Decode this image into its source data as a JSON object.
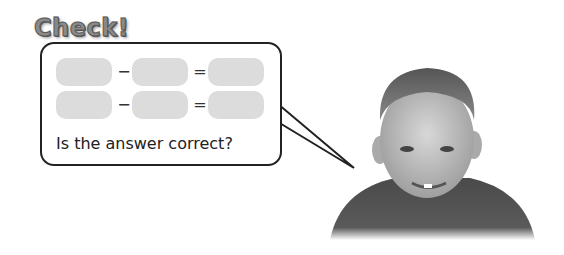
{
  "title": "Check!",
  "bubble": {
    "rows": [
      {
        "op1": "−",
        "op2": "="
      },
      {
        "op1": "−",
        "op2": "="
      }
    ],
    "question": "Is the answer correct?"
  },
  "image": {
    "subject": "smiling-boy-photo"
  }
}
